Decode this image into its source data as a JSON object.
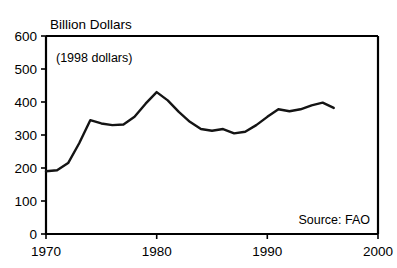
{
  "figure": {
    "y_axis_title": "Billion Dollars",
    "in_plot_note": "(1998 dollars)",
    "source_note": "Source: FAO"
  },
  "chart_data": {
    "type": "line",
    "title": "Billion Dollars",
    "subtitle": "(1998 dollars)",
    "xlabel": "",
    "ylabel": "Billion Dollars",
    "annotations": [
      "(1998 dollars)",
      "Source: FAO"
    ],
    "grid": false,
    "legend": "none",
    "xlim": [
      1970,
      2000
    ],
    "ylim": [
      0,
      600
    ],
    "xticks": [
      1970,
      1980,
      1990,
      2000
    ],
    "xtick_labels": [
      "1970",
      "1980",
      "1990",
      "2000"
    ],
    "yticks": [
      0,
      100,
      200,
      300,
      400,
      500,
      600
    ],
    "ytick_labels": [
      "0",
      "100",
      "200",
      "300",
      "400",
      "500",
      "600"
    ],
    "series": [
      {
        "name": "Value of world agricultural trade",
        "color": "#141414",
        "x": [
          1970,
          1971,
          1972,
          1973,
          1974,
          1975,
          1976,
          1977,
          1978,
          1979,
          1980,
          1981,
          1982,
          1983,
          1984,
          1985,
          1986,
          1987,
          1988,
          1989,
          1990,
          1991,
          1992,
          1993,
          1994,
          1995,
          1996
        ],
        "values": [
          190,
          193,
          215,
          275,
          345,
          335,
          330,
          332,
          355,
          395,
          430,
          405,
          370,
          340,
          318,
          313,
          318,
          305,
          310,
          330,
          355,
          378,
          372,
          378,
          390,
          398,
          382
        ]
      }
    ]
  }
}
